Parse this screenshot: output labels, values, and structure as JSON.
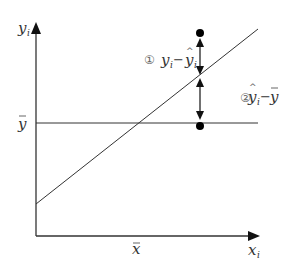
{
  "diagram": {
    "type": "regression-deviation-decomposition",
    "axes": {
      "y_label": "y",
      "y_label_subscript": "i",
      "x_label": "x",
      "x_label_subscript": "i",
      "y_mean_label": "y",
      "x_mean_label": "x"
    },
    "annotations": [
      {
        "marker": "①",
        "text": "y",
        "sub": "i",
        "op": " − ",
        "text2": "y",
        "sub2": "i",
        "meaning": "y_i − ŷ_i"
      },
      {
        "marker": "②",
        "text": "y",
        "sub": "i",
        "op": "−",
        "text2": "y",
        "meaning": "ŷ_i − ȳ"
      }
    ],
    "colors": {
      "line": "#333333",
      "point": "#000000",
      "background": "#ffffff"
    }
  }
}
